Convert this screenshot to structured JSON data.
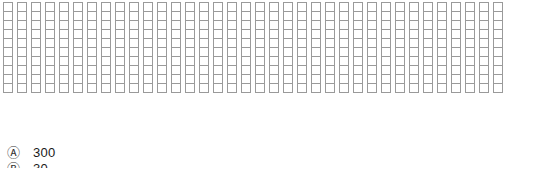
{
  "grid": {
    "columns": 36,
    "rows": 10,
    "cell_border_color": "#9a9a9a",
    "cell_fill_color": "#ffffff",
    "background_color": "#ffffff"
  },
  "legend": {
    "rows": [
      {
        "marker": "circled-letter-a-icon",
        "symbol": "Ⓐ",
        "value": "300"
      },
      {
        "marker": "circled-letter-b-icon",
        "symbol": "Ⓑ",
        "value": "30"
      }
    ]
  },
  "chart_data": {
    "type": "bar",
    "title": "",
    "xlabel": "",
    "ylabel": "",
    "categories": [
      "1",
      "2",
      "3",
      "4",
      "5",
      "6",
      "7",
      "8",
      "9",
      "10",
      "11",
      "12",
      "13",
      "14",
      "15",
      "16",
      "17",
      "18",
      "19",
      "20",
      "21",
      "22",
      "23",
      "24",
      "25",
      "26",
      "27",
      "28",
      "29",
      "30",
      "31",
      "32",
      "33",
      "34",
      "35",
      "36"
    ],
    "values": [
      10,
      10,
      10,
      10,
      10,
      10,
      10,
      10,
      10,
      10,
      10,
      10,
      10,
      10,
      10,
      10,
      10,
      10,
      10,
      10,
      10,
      10,
      10,
      10,
      10,
      10,
      10,
      10,
      10,
      10,
      10,
      10,
      10,
      10,
      10,
      10
    ],
    "ylim": [
      0,
      10
    ],
    "grid": true,
    "legend_position": "bottom-left",
    "legend_entries": [
      {
        "label": "Ⓐ",
        "value": 300
      },
      {
        "label": "Ⓑ",
        "value": 30
      }
    ]
  }
}
